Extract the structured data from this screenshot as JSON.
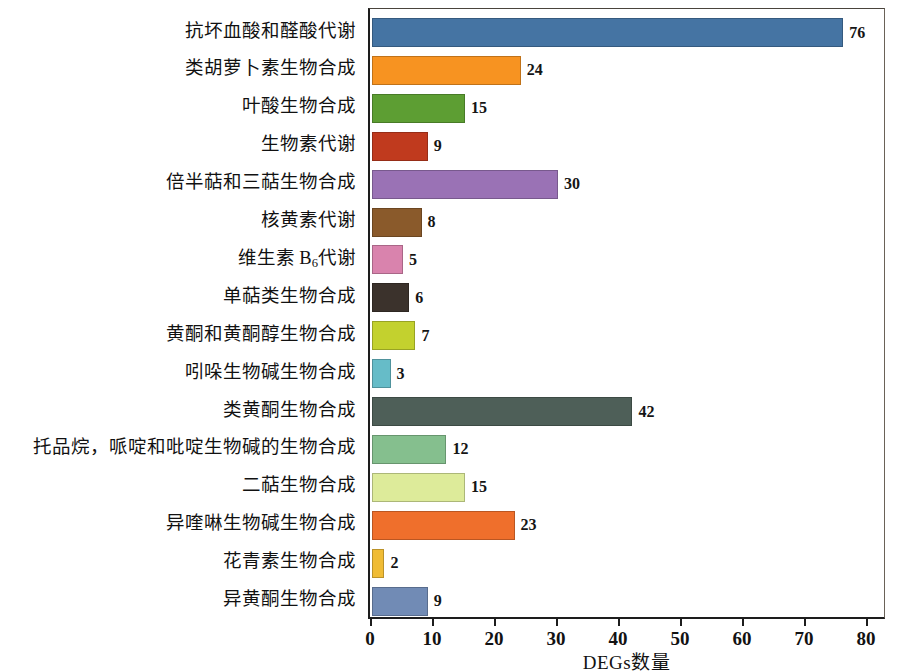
{
  "chart_data": {
    "type": "bar",
    "orientation": "horizontal",
    "title": "",
    "xlabel": "DEGs数量",
    "ylabel": "",
    "xlim": [
      0,
      80
    ],
    "xticks": [
      0,
      10,
      20,
      30,
      40,
      50,
      60,
      70,
      80
    ],
    "xtick_labels": [
      "0",
      "10",
      "20",
      "30",
      "40",
      "50",
      "60",
      "70",
      "80"
    ],
    "grid": false,
    "legend": "none",
    "categories": [
      "抗坏血酸和醛酸代谢",
      "类胡萝卜素生物合成",
      "叶酸生物合成",
      "生物素代谢",
      "倍半萜和三萜生物合成",
      "核黄素代谢",
      "维生素 B6 代谢",
      "单萜类生物合成",
      "黄酮和黄酮醇生物合成",
      "吲哚生物碱生物合成",
      "类黄酮生物合成",
      "托品烷，哌啶和吡啶生物碱的生物合成",
      "二萜生物合成",
      "异喹啉生物碱生物合成",
      "花青素生物合成",
      "异黄酮生物合成"
    ],
    "values": [
      76,
      24,
      15,
      9,
      30,
      8,
      5,
      6,
      7,
      3,
      42,
      12,
      15,
      23,
      2,
      9
    ],
    "value_labels": [
      "76",
      "24",
      "15",
      "9",
      "30",
      "8",
      "5",
      "6",
      "7",
      "3",
      "42",
      "12",
      "15",
      "23",
      "2",
      "9"
    ],
    "bar_colors": [
      "#4574a3",
      "#f79321",
      "#5d9e33",
      "#c03a1e",
      "#9a72b5",
      "#8a5a2b",
      "#d983ad",
      "#3b322c",
      "#c3d12e",
      "#66bcc8",
      "#4e5f58",
      "#85bf8e",
      "#ddeb9a",
      "#ef6f2c",
      "#f0bc35",
      "#718bb5"
    ],
    "special_labels": {
      "vitamin_b6": {
        "prefix": "维生素 B",
        "subscript": "6",
        "suffix": "代谢"
      }
    }
  }
}
